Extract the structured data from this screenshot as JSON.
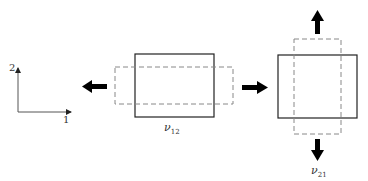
{
  "axes": {
    "x_label": "1",
    "y_label": "2"
  },
  "panels": [
    {
      "label_symbol": "ν",
      "label_sub": "12",
      "load": "tension along 1",
      "contraction": "along 2"
    },
    {
      "label_symbol": "ν",
      "label_sub": "21",
      "load": "tension along 2",
      "contraction": "along 1"
    }
  ],
  "colors": {
    "solid": "#222222",
    "dashed": "#888888",
    "arrow": "#000000"
  }
}
